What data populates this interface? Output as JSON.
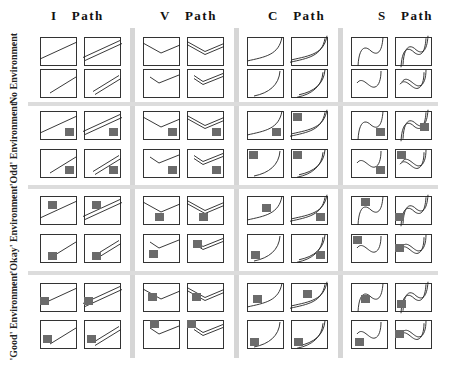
{
  "columns": [
    {
      "label": "I   Path",
      "x": 51
    },
    {
      "label": "V   Path",
      "x": 158
    },
    {
      "label": "C   Path",
      "x": 268
    },
    {
      "label": "S   Path",
      "x": 375
    }
  ],
  "rows": [
    {
      "label": "No Environment",
      "top": 37
    },
    {
      "label": "'Odd' Environment",
      "top": 111
    },
    {
      "label": "'Okay' Environment",
      "top": 196
    },
    {
      "label": "'Good' Environment",
      "top": 283
    }
  ],
  "colors": {
    "line": "#222222",
    "box": "#333333",
    "obstacle": "#6b6b6b",
    "divider": "#d6d6d6"
  },
  "legend_note": "Grid of path shapes (I, V, C, S) × environments (None, Odd, Okay, Good); each cell shows single/double path, full/partial length, with grey obstacle squares"
}
